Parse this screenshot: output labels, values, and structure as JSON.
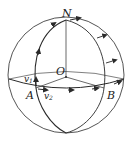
{
  "diagram": {
    "type": "sphere-geometry",
    "labels": {
      "north": "N",
      "center": "O",
      "point_a": "A",
      "point_b": "B",
      "v1": "v",
      "v1_sub": "1",
      "v2": "v",
      "v2_sub": "2"
    },
    "colors": {
      "stroke": "#2a2a2a",
      "background": "#ffffff"
    }
  }
}
